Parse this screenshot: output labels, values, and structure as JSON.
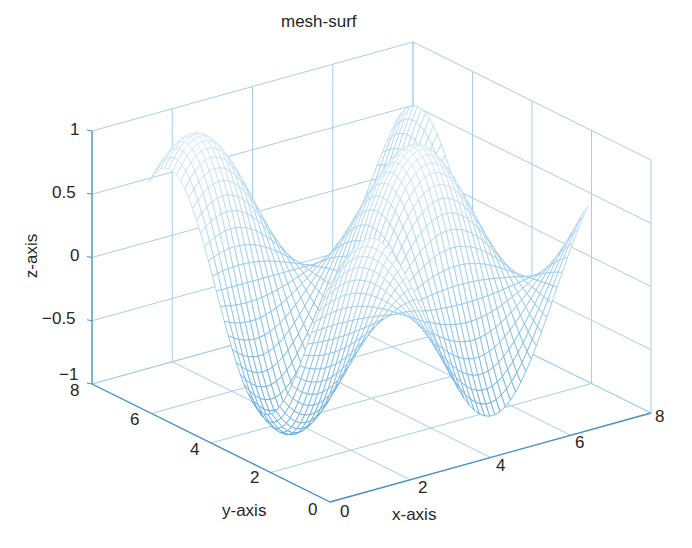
{
  "chart_data": {
    "type": "surface-mesh",
    "title": "mesh-surf",
    "xlabel": "x-axis",
    "ylabel": "y-axis",
    "zlabel": "z-axis",
    "xlim": [
      0,
      8
    ],
    "ylim": [
      0,
      8
    ],
    "zlim": [
      -1,
      1
    ],
    "xticks": [
      "0",
      "2",
      "4",
      "6",
      "8"
    ],
    "yticks": [
      "0",
      "2",
      "4",
      "6",
      "8"
    ],
    "zticks": [
      "-1",
      "-0.5",
      "0",
      "0.5",
      "1"
    ],
    "grid": true,
    "function_approx": "z = sin(x)*sin(y+1.2) style wave, range [-1, 1]",
    "colors": {
      "mesh": "#5aa9e6",
      "grid": "#a9cde8",
      "axis": "#4a90c9"
    }
  },
  "title": "mesh-surf",
  "labels": {
    "x": "x-axis",
    "y": "y-axis",
    "z": "z-axis"
  },
  "ticks": {
    "z": [
      "1",
      "0.5",
      "0",
      "−0.5",
      "−1"
    ],
    "y": [
      "8",
      "6",
      "4",
      "2",
      "0"
    ],
    "x": [
      "0",
      "2",
      "4",
      "6",
      "8"
    ]
  }
}
